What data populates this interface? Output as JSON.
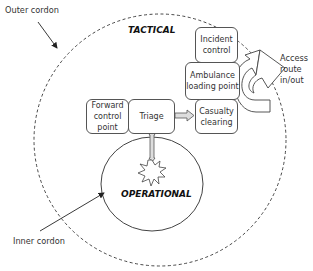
{
  "diagram": {
    "type": "incident-scene-cordon-layout",
    "colors": {
      "stroke": "#555555",
      "text": "#333333",
      "arrow_fill": "#dddddd"
    },
    "zones": {
      "tactical": "TACTICAL",
      "operational": "OPERATIONAL"
    },
    "cordons": {
      "outer": "Outer cordon",
      "inner": "Inner cordon"
    },
    "boxes": {
      "incident_control": "Incident control",
      "ambulance_loading": "Ambulance loading point",
      "casualty_clearing": "Casualty clearing",
      "forward_control": "Forward control point",
      "triage": "Triage"
    },
    "access_route": "Access route in/out"
  }
}
